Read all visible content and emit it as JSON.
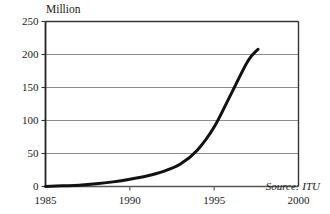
{
  "chart_data": {
    "type": "line",
    "title": "",
    "subtitle": "",
    "unit_label": "Million",
    "xlabel": "",
    "ylabel": "Million",
    "xlim": [
      1985,
      2000
    ],
    "ylim": [
      0,
      250
    ],
    "grid": true,
    "legend": null,
    "x_ticks": [
      1985,
      1990,
      1995,
      2000
    ],
    "x_tick_labels": [
      "1985",
      "1990",
      "1995",
      "2000"
    ],
    "y_ticks": [
      0,
      50,
      100,
      150,
      200,
      250
    ],
    "y_tick_labels": [
      "0",
      "50",
      "100",
      "150",
      "200",
      "250"
    ],
    "gridlines_y": [
      50,
      100,
      150,
      200
    ],
    "annotations": [
      {
        "text": "Source: ITU",
        "position": "inside-bottom-right",
        "style": "italic"
      }
    ],
    "series": [
      {
        "name": "Mobile subscribers",
        "color": "#111111",
        "line_width": 3,
        "x": [
          1985,
          1986,
          1987,
          1988,
          1989,
          1990,
          1991,
          1992,
          1993,
          1994,
          1995,
          1996,
          1997,
          1997.6
        ],
        "values": [
          0,
          1,
          2,
          4,
          7,
          11,
          16,
          23,
          34,
          55,
          90,
          140,
          190,
          208
        ]
      }
    ]
  },
  "axes": {
    "unit_label": "Million",
    "source_note": "Source: ITU"
  }
}
